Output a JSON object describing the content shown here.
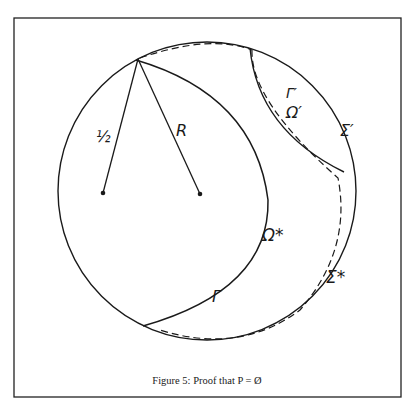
{
  "figure": {
    "caption": "Figure 5:  Proof that   P = Ø",
    "labels": {
      "half": "½",
      "R": "R",
      "gamma_prime": "Γ′",
      "omega_prime": "Ω′",
      "sigma_prime": "Σ′",
      "omega_star": "Ω*",
      "sigma_star": "Σ*",
      "gamma": "Γ"
    }
  }
}
